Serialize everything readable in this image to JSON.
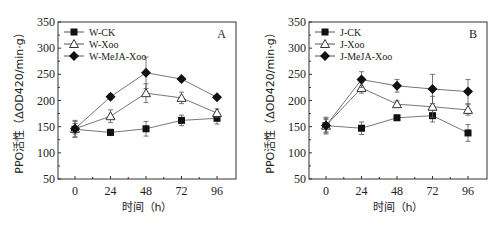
{
  "chart_data": [
    {
      "type": "line",
      "panel_label": "A",
      "title": "",
      "xlabel": "时间（h）",
      "ylabel": "PPO活性（ΔOD420/min·g）",
      "x": [
        0,
        24,
        48,
        72,
        96
      ],
      "ylim": [
        50,
        350
      ],
      "yticks": [
        50,
        100,
        150,
        200,
        250,
        300,
        350
      ],
      "grid": false,
      "legend_position": "upper-left",
      "series": [
        {
          "name": "W-CK",
          "marker": "filled-square",
          "values": [
            145,
            139,
            146,
            162,
            166
          ],
          "errors": [
            15,
            6,
            14,
            10,
            11
          ]
        },
        {
          "name": "W-Xoo",
          "marker": "open-triangle",
          "values": [
            146,
            170,
            214,
            205,
            176
          ],
          "errors": [
            16,
            12,
            18,
            11,
            8
          ]
        },
        {
          "name": "W-MeJA-Xoo",
          "marker": "filled-diamond",
          "values": [
            146,
            207,
            253,
            241,
            206
          ],
          "errors": [
            10,
            5,
            30,
            4,
            3
          ]
        }
      ]
    },
    {
      "type": "line",
      "panel_label": "B",
      "title": "",
      "xlabel": "时间（h）",
      "ylabel": "PPO活性（ΔOD420/min·g）",
      "x": [
        0,
        24,
        48,
        72,
        96
      ],
      "ylim": [
        50,
        350
      ],
      "yticks": [
        50,
        100,
        150,
        200,
        250,
        300,
        350
      ],
      "grid": false,
      "legend_position": "upper-left",
      "series": [
        {
          "name": "J-CK",
          "marker": "filled-square",
          "values": [
            152,
            147,
            167,
            171,
            138
          ],
          "errors": [
            16,
            12,
            5,
            12,
            16
          ]
        },
        {
          "name": "J-Xoo",
          "marker": "open-triangle",
          "values": [
            152,
            224,
            193,
            188,
            182
          ],
          "errors": [
            14,
            10,
            6,
            20,
            10
          ]
        },
        {
          "name": "J-MeJA-Xoo",
          "marker": "filled-diamond",
          "values": [
            152,
            240,
            228,
            222,
            217
          ],
          "errors": [
            12,
            15,
            12,
            28,
            23
          ]
        }
      ]
    }
  ]
}
